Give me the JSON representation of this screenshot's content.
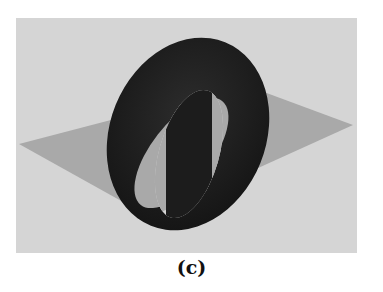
{
  "figure": {
    "colors": {
      "background": "#d5d5d5",
      "plane": "#a9a9a9",
      "torus": "#1b1b1b",
      "torus_highlight": "#2e2e2e"
    }
  },
  "caption": {
    "label": "(c)"
  }
}
